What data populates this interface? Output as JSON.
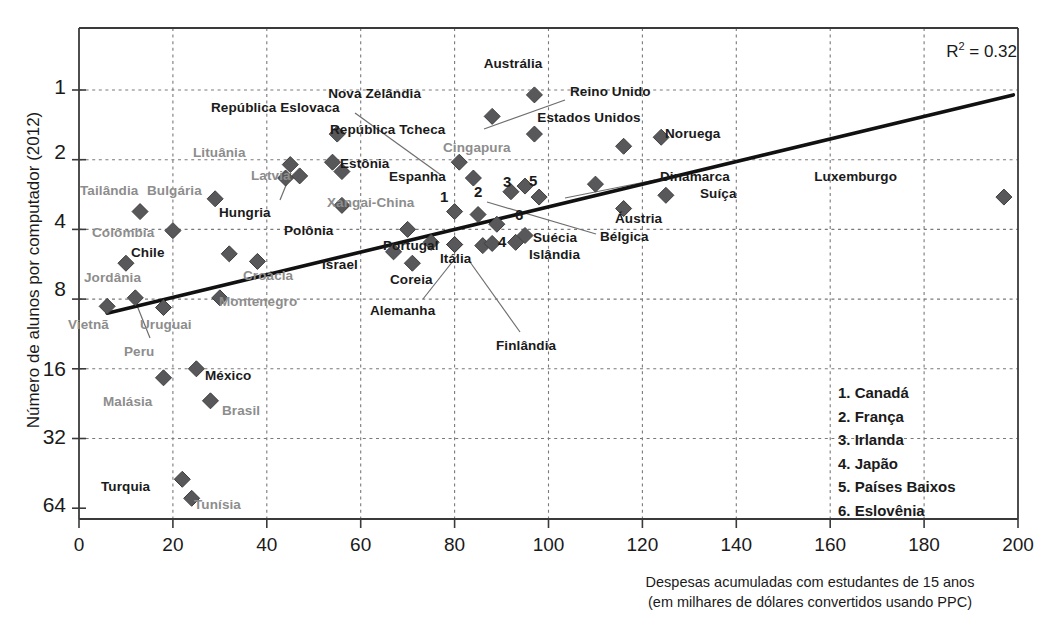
{
  "chart_data": {
    "type": "scatter",
    "title": "",
    "xlabel": "Despesas acumuladas com estudantes de 15 anos (em milhares de dólares convertidos usando PPC)",
    "ylabel": "Número de alunos por computador (2012)",
    "xlim": [
      0,
      200
    ],
    "ylim_log2": [
      1,
      64
    ],
    "yscale": "log2-inverted",
    "grid": true,
    "xticks": [
      "0",
      "20",
      "40",
      "60",
      "80",
      "100",
      "120",
      "140",
      "160",
      "180",
      "200"
    ],
    "yticks": [
      "1",
      "2",
      "4",
      "8",
      "16",
      "32",
      "64"
    ],
    "annotation": "R2 = 0.32",
    "r_squared": 0.32,
    "trendline": {
      "x0": 6,
      "y0": 9.2,
      "x1": 199,
      "y1": 1.05
    },
    "points": [
      {
        "label": "Austrália",
        "x": 97,
        "y": 1.05,
        "oecd": true,
        "lx": 513,
        "ly": 56,
        "align": "center"
      },
      {
        "label": "Nova Zelândia",
        "x": 88,
        "y": 1.3,
        "oecd": true,
        "lx": 421,
        "ly": 86,
        "align": "right"
      },
      {
        "label": "Reino Unido",
        "x": 97,
        "y": 1.55,
        "oecd": true,
        "lx": 570,
        "ly": 84,
        "align": "left",
        "leader": [
          565,
          100,
          484,
          129
        ]
      },
      {
        "label": "República Eslovaca",
        "x": 54,
        "y": 2.05,
        "oecd": true,
        "lx": 211,
        "ly": 100,
        "align": "left",
        "leader": [
          355,
          113,
          441,
          175
        ]
      },
      {
        "label": "República Tcheca",
        "x": 55,
        "y": 1.55,
        "oecd": true,
        "lx": 330,
        "ly": 122,
        "align": "left"
      },
      {
        "label": "Estados Unidos",
        "x": 116,
        "y": 1.75,
        "oecd": true,
        "lx": 589,
        "ly": 110,
        "align": "center"
      },
      {
        "label": "Noruega",
        "x": 124,
        "y": 1.6,
        "oecd": true,
        "lx": 665,
        "ly": 126,
        "align": "left"
      },
      {
        "label": "Cingapura",
        "x": 81,
        "y": 2.05,
        "oecd": false,
        "lx": 443,
        "ly": 140,
        "align": "left"
      },
      {
        "label": "Lituânia",
        "x": 45,
        "y": 2.1,
        "oecd": false,
        "lx": 193,
        "ly": 145,
        "align": "left"
      },
      {
        "label": "Estônia",
        "x": 56,
        "y": 2.25,
        "oecd": true,
        "lx": 340,
        "ly": 156,
        "align": "left"
      },
      {
        "label": "Latvia",
        "x": 47,
        "y": 2.35,
        "oecd": false,
        "lx": 251,
        "ly": 168,
        "align": "left"
      },
      {
        "label": "Espanha",
        "x": 84,
        "y": 2.4,
        "oecd": true,
        "lx": 389,
        "ly": 169,
        "align": "left"
      },
      {
        "label": "Dinamarca",
        "x": 110,
        "y": 2.55,
        "oecd": true,
        "lx": 660,
        "ly": 169,
        "align": "left",
        "leader": [
          655,
          180,
          565,
          198
        ]
      },
      {
        "label": "Luxemburgo",
        "x": 197,
        "y": 2.9,
        "oecd": true,
        "lx": 897,
        "ly": 169,
        "align": "right"
      },
      {
        "label": "Tailândia",
        "x": 13,
        "y": 3.35,
        "oecd": false,
        "lx": 80,
        "ly": 183,
        "align": "left"
      },
      {
        "label": "Bulgária",
        "x": 29,
        "y": 2.95,
        "oecd": false,
        "lx": 147,
        "ly": 183,
        "align": "left"
      },
      {
        "label": "Suíça",
        "x": 125,
        "y": 2.85,
        "oecd": true,
        "lx": 700,
        "ly": 186,
        "align": "left"
      },
      {
        "label": "Xangai-China",
        "x": 56,
        "y": 3.15,
        "oecd": false,
        "lx": 327,
        "ly": 195,
        "align": "left"
      },
      {
        "label": "Hungria",
        "x": 44,
        "y": 2.4,
        "oecd": true,
        "lx": 219,
        "ly": 205,
        "align": "left",
        "leader": [
          280,
          200,
          291,
          173
        ]
      },
      {
        "label": "Áustria",
        "x": 116,
        "y": 3.25,
        "oecd": true,
        "lx": 615,
        "ly": 211,
        "align": "left"
      },
      {
        "label": "Colômbia",
        "x": 20,
        "y": 4.05,
        "oecd": false,
        "lx": 92,
        "ly": 225,
        "align": "left"
      },
      {
        "label": "Polônia",
        "x": 70,
        "y": 4.0,
        "oecd": true,
        "lx": 284,
        "ly": 223,
        "align": "left"
      },
      {
        "label": "Bélgica",
        "x": 98,
        "y": 2.9,
        "oecd": true,
        "lx": 600,
        "ly": 229,
        "align": "left",
        "leader": [
          596,
          234,
          487,
          202
        ]
      },
      {
        "label": "Portugal",
        "x": 75,
        "y": 4.55,
        "oecd": true,
        "lx": 383,
        "ly": 238,
        "align": "left"
      },
      {
        "label": "Itália",
        "x": 80,
        "y": 4.65,
        "oecd": true,
        "lx": 440,
        "ly": 251,
        "align": "left"
      },
      {
        "label": "Suécia",
        "x": 95,
        "y": 4.25,
        "oecd": true,
        "lx": 533,
        "ly": 230,
        "align": "left"
      },
      {
        "label": "Islândia",
        "x": 93,
        "y": 4.55,
        "oecd": true,
        "lx": 529,
        "ly": 247,
        "align": "left"
      },
      {
        "label": "Chile",
        "x": 32,
        "y": 5.1,
        "oecd": true,
        "lx": 131,
        "ly": 245,
        "align": "left"
      },
      {
        "label": "Israel",
        "x": 67,
        "y": 5.0,
        "oecd": true,
        "lx": 322,
        "ly": 257,
        "align": "left"
      },
      {
        "label": "Jordânia",
        "x": 10,
        "y": 5.6,
        "oecd": false,
        "lx": 84,
        "ly": 270,
        "align": "left"
      },
      {
        "label": "Croácia",
        "x": 38,
        "y": 5.5,
        "oecd": false,
        "lx": 243,
        "ly": 268,
        "align": "left"
      },
      {
        "label": "Coreia",
        "x": 71,
        "y": 5.6,
        "oecd": true,
        "lx": 390,
        "ly": 272,
        "align": "left"
      },
      {
        "label": "Alemanha",
        "x": 80,
        "y": 4.65,
        "oecd": true,
        "lx": 370,
        "ly": 303,
        "align": "left",
        "leader": [
          423,
          299,
          457,
          256
        ]
      },
      {
        "label": "Montenegro",
        "x": 30,
        "y": 7.9,
        "oecd": false,
        "lx": 219,
        "ly": 294,
        "align": "left"
      },
      {
        "label": "Vietnã",
        "x": 6,
        "y": 8.6,
        "oecd": false,
        "lx": 68,
        "ly": 317,
        "align": "left"
      },
      {
        "label": "Uruguai",
        "x": 18,
        "y": 8.7,
        "oecd": false,
        "lx": 140,
        "ly": 317,
        "align": "left"
      },
      {
        "label": "Peru",
        "x": 12,
        "y": 7.9,
        "oecd": false,
        "lx": 124,
        "ly": 344,
        "align": "left",
        "leader": [
          150,
          338,
          136,
          303
        ]
      },
      {
        "label": "Finlândia",
        "x": 86,
        "y": 4.7,
        "oecd": true,
        "lx": 496,
        "ly": 338,
        "align": "left",
        "leader": [
          520,
          332,
          470,
          262
        ]
      },
      {
        "label": "México",
        "x": 25,
        "y": 16.0,
        "oecd": true,
        "lx": 205,
        "ly": 368,
        "align": "left"
      },
      {
        "label": "Malásia",
        "x": 18,
        "y": 17.5,
        "oecd": false,
        "lx": 103,
        "ly": 394,
        "align": "left"
      },
      {
        "label": "Brasil",
        "x": 28,
        "y": 22.0,
        "oecd": false,
        "lx": 222,
        "ly": 403,
        "align": "left"
      },
      {
        "label": "Turquia",
        "x": 22,
        "y": 48.0,
        "oecd": true,
        "lx": 101,
        "ly": 479,
        "align": "left"
      },
      {
        "label": "Tunísia",
        "x": 24,
        "y": 58.0,
        "oecd": false,
        "lx": 194,
        "ly": 497,
        "align": "left"
      }
    ],
    "numbered_points": [
      {
        "num": "1",
        "label": "Canadá",
        "x": 80,
        "y": 3.35,
        "nx": 440,
        "ny": 188
      },
      {
        "num": "2",
        "label": "França",
        "x": 85,
        "y": 3.45,
        "nx": 474,
        "ny": 183
      },
      {
        "num": "3",
        "label": "Irlanda",
        "x": 92,
        "y": 2.75,
        "nx": 503,
        "ny": 173
      },
      {
        "num": "4",
        "label": "Japão",
        "x": 88,
        "y": 4.6,
        "nx": 498,
        "ny": 233
      },
      {
        "num": "5",
        "label": "Países Baixos",
        "x": 95,
        "y": 2.6,
        "nx": 529,
        "ny": 172
      },
      {
        "num": "6",
        "label": "Eslovênia",
        "x": 89,
        "y": 3.8,
        "nx": 515,
        "ny": 206
      }
    ],
    "legend_entries": [
      "1. Canadá",
      "2. França",
      "3. Irlanda",
      "4. Japão",
      "5. Países Baixos",
      "6. Eslovênia"
    ],
    "colors": {
      "marker": "#58585a",
      "oecd_label": "#1a1a1a",
      "partner_label": "#8d8d8d",
      "trendline": "#111111",
      "grid": "#7a7a7a",
      "axis": "#3a3a3a"
    }
  }
}
